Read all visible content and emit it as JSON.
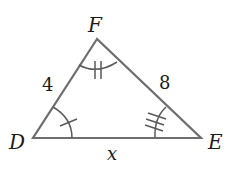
{
  "diagram": {
    "type": "triangle",
    "colors": {
      "stroke": "#6e6e6e",
      "text": "#1a1a1a",
      "background": "#ffffff"
    },
    "vertices": [
      {
        "name": "F",
        "x": 97,
        "y": 39
      },
      {
        "name": "D",
        "x": 33,
        "y": 138
      },
      {
        "name": "E",
        "x": 201,
        "y": 138
      }
    ],
    "vertex_labels": {
      "F": "F",
      "D": "D",
      "E": "E"
    },
    "sides": [
      {
        "between": "DF",
        "label": "4"
      },
      {
        "between": "FE",
        "label": "8"
      },
      {
        "between": "DE",
        "label": "x"
      }
    ],
    "angle_marks": [
      {
        "vertex": "D",
        "ticks": 1
      },
      {
        "vertex": "F",
        "ticks": 2
      },
      {
        "vertex": "E",
        "ticks": 3
      }
    ]
  }
}
